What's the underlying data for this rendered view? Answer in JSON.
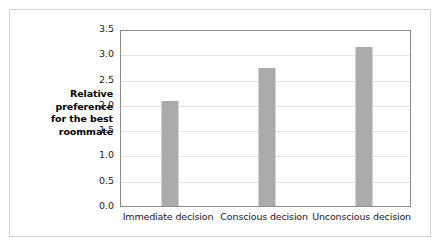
{
  "figure": {
    "background_color": "#ffffff",
    "card_border_color": "#d3d3d3",
    "plot_border_color": "#8c8c8c",
    "gridline_color": "#e2e2e2"
  },
  "y_axis_title_lines": [
    "Relative",
    "preference",
    "for the best",
    "roommate"
  ],
  "chart_data": {
    "type": "bar",
    "title": "",
    "xlabel": "",
    "ylabel": "Relative preference for the best roommate",
    "categories": [
      "Immediate decision",
      "Conscious decision",
      "Unconscious decision"
    ],
    "values": [
      2.07,
      2.72,
      3.15
    ],
    "ylim": [
      0.0,
      3.5
    ],
    "ytick_labels": [
      "0.0",
      "0.5",
      "1.0",
      "1.5",
      "2.0",
      "2.5",
      "3.0",
      "3.5"
    ],
    "ytick_values": [
      0.0,
      0.5,
      1.0,
      1.5,
      2.0,
      2.5,
      3.0,
      3.5
    ],
    "grid": true,
    "grid_axis": "y",
    "legend": false,
    "legend_position": "none",
    "bar_color": "#ababab",
    "series": [
      {
        "name": "Relative preference for the best roommate",
        "values": [
          2.07,
          2.72,
          3.15
        ]
      }
    ]
  }
}
